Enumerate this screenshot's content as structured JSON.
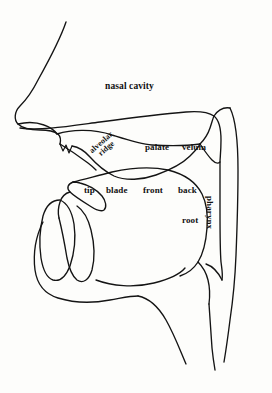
{
  "diagram": {
    "title": "nasal cavity",
    "type": "sagittal-vocal-tract",
    "colors": {
      "stroke": "#141414",
      "background": "#fdfdfb",
      "text": "#111111"
    },
    "labels": {
      "nasal_cavity": "nasal cavity",
      "palate": "palate",
      "velum": "velum",
      "alveolar_ridge_line1": "alveolar",
      "alveolar_ridge_line2": "ridge",
      "tip": "tip",
      "blade": "blade",
      "front": "front",
      "back": "back",
      "root": "root",
      "pharynx": "pharynx"
    }
  }
}
